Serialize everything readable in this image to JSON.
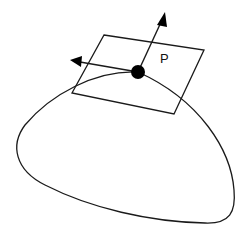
{
  "diagram": {
    "point_label": "P",
    "colors": {
      "stroke": "#1a1a1a",
      "point_fill": "#000000",
      "background": "#ffffff"
    },
    "elements": [
      {
        "id": "surface",
        "type": "closed-curve",
        "description": "rounded blob surface outline"
      },
      {
        "id": "tangent-plane",
        "type": "parallelogram",
        "description": "tangent plane touching surface at P"
      },
      {
        "id": "point-p",
        "type": "filled-circle",
        "label": "P"
      },
      {
        "id": "normal-vector",
        "type": "arrow",
        "direction": "up-right"
      },
      {
        "id": "tangent-vector",
        "type": "arrow",
        "direction": "left"
      }
    ]
  }
}
